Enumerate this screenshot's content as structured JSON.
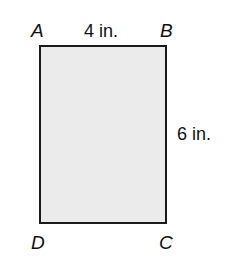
{
  "diagram": {
    "shape": "rectangle",
    "fill_color": "#ebebeb",
    "stroke_color": "#1a1a1a",
    "vertices": {
      "top_left": "A",
      "top_right": "B",
      "bottom_right": "C",
      "bottom_left": "D"
    },
    "dimensions": {
      "top": "4 in.",
      "right": "6 in."
    }
  }
}
